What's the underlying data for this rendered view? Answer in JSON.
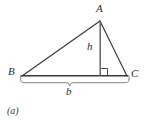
{
  "figure": {
    "caption": "(a)",
    "type": "geometry-diagram",
    "colors": {
      "stroke": "#3a3a3a",
      "brace": "#8c8c8c",
      "background": "#ffffff",
      "label": "#2b2b2b"
    },
    "vertices": [
      {
        "name": "A",
        "label": "A",
        "x": 100,
        "y": 21
      },
      {
        "name": "B",
        "label": "B",
        "x": 22,
        "y": 76
      },
      {
        "name": "C",
        "label": "C",
        "x": 127,
        "y": 76
      }
    ],
    "segments": [
      {
        "name": "side-AB",
        "from": "A",
        "to": "B"
      },
      {
        "name": "side-AC",
        "from": "A",
        "to": "C"
      },
      {
        "name": "side-BC",
        "from": "B",
        "to": "C"
      }
    ],
    "altitude": {
      "label": "h",
      "from_x": 100,
      "from_y": 21,
      "to_x": 100,
      "to_y": 76,
      "right_angle": true
    },
    "base_measure": {
      "label": "b",
      "from_x": 20,
      "to_x": 129,
      "y": 78
    }
  }
}
